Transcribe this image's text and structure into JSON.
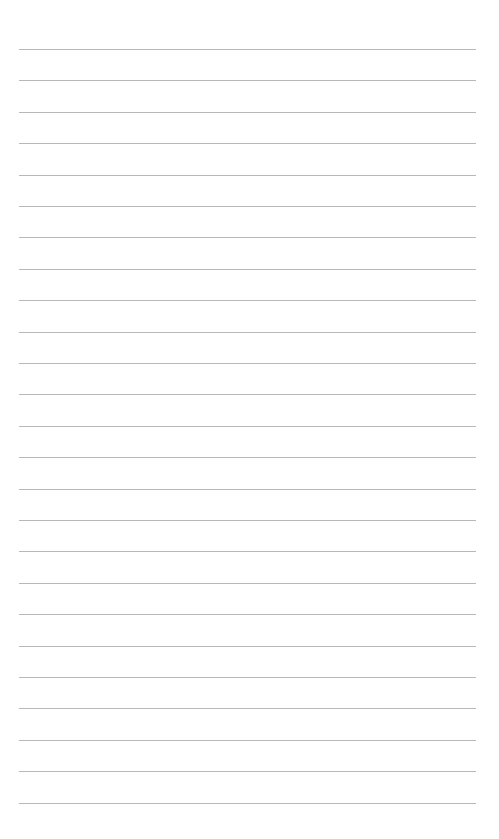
{
  "page": {
    "type": "lined-paper",
    "background": "#ffffff",
    "line_color": "#b8b8b8",
    "line_count": 25,
    "first_line_y": 49,
    "line_spacing": 31.4,
    "line_left": 19,
    "line_width": 457
  }
}
